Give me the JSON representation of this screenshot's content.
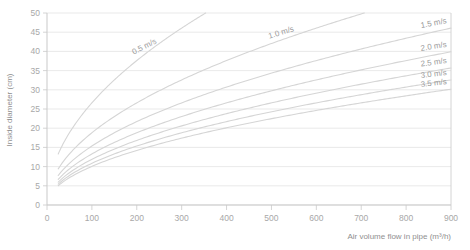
{
  "chart_data": {
    "type": "line",
    "title": "",
    "xlabel": "Air volume flow in pipe (m³/h)",
    "ylabel": "Inside diameter (cm)",
    "xlim": [
      0,
      900
    ],
    "ylim": [
      0,
      50
    ],
    "xticks": [
      0,
      100,
      200,
      300,
      400,
      500,
      600,
      700,
      800,
      900
    ],
    "yticks": [
      0,
      5,
      10,
      15,
      20,
      25,
      30,
      35,
      40,
      45,
      50
    ],
    "xtick_labels": [
      "0",
      "100",
      "200",
      "300",
      "400",
      "500",
      "600",
      "700",
      "800",
      "900"
    ],
    "ytick_labels": [
      "0",
      "5",
      "10",
      "15",
      "20",
      "25",
      "30",
      "35",
      "40",
      "45",
      "50"
    ],
    "grid": "horizontal",
    "legend": "inline-curve-labels",
    "line_color": "#d5d5d5",
    "grid_color": "#e3e3e3",
    "axis_color": "#c9c9c9",
    "text_color": "#a8a8a8",
    "relation": "d_cm = 200 * sqrt(Q / (3600 * pi * v))",
    "series": [
      {
        "name": "0.5 m/s",
        "velocity": 0.5,
        "label": "0.5 m/s",
        "label_rotation": -27,
        "x": [
          25,
          50,
          75,
          100,
          150,
          200,
          250,
          300,
          350
        ],
        "values": [
          4.7,
          6.7,
          8.2,
          9.4,
          11.5,
          13.3,
          14.9,
          16.3,
          17.6
        ]
      },
      {
        "name": "1.0 m/s",
        "velocity": 1.0,
        "label": "1.0 m/s",
        "label_rotation": -17,
        "x": [
          25,
          50,
          100,
          200,
          300,
          400,
          500,
          600,
          700
        ],
        "values": [
          3.3,
          4.7,
          6.7,
          9.4,
          11.5,
          13.3,
          14.9,
          16.3,
          17.6
        ]
      },
      {
        "name": "1.5 m/s",
        "velocity": 1.5,
        "label": "1.5 m/s",
        "label_rotation": -11,
        "x": [
          25,
          100,
          200,
          400,
          600,
          800,
          900
        ],
        "values": [
          2.7,
          5.5,
          7.7,
          10.9,
          13.3,
          15.4,
          16.3
        ]
      },
      {
        "name": "2.0 m/s",
        "velocity": 2.0,
        "label": "2.0 m/s",
        "label_rotation": -9,
        "x": [
          25,
          100,
          200,
          400,
          600,
          800,
          900
        ],
        "values": [
          2.4,
          4.7,
          6.7,
          9.4,
          11.5,
          13.3,
          14.1
        ]
      },
      {
        "name": "2.5 m/s",
        "velocity": 2.5,
        "label": "2.5 m/s",
        "label_rotation": -8,
        "x": [
          25,
          100,
          200,
          400,
          600,
          800,
          900
        ],
        "values": [
          2.1,
          4.2,
          6.0,
          8.4,
          10.3,
          11.9,
          12.6
        ]
      },
      {
        "name": "3.0 m/s",
        "velocity": 3.0,
        "label": "3.0 m/s",
        "label_rotation": -7,
        "x": [
          25,
          100,
          200,
          400,
          600,
          800,
          900
        ],
        "values": [
          1.9,
          3.8,
          5.5,
          7.7,
          9.4,
          10.9,
          11.5
        ]
      },
      {
        "name": "3.5 m/s",
        "velocity": 3.5,
        "label": "3.5 m/s",
        "label_rotation": -6,
        "x": [
          25,
          100,
          200,
          400,
          600,
          800,
          900
        ],
        "values": [
          1.8,
          3.6,
          5.1,
          7.1,
          8.7,
          10.1,
          10.7
        ]
      }
    ]
  },
  "axes": {
    "x_title": "Air volume flow in pipe (m³/h)",
    "y_title": "Inside diameter (cm)"
  }
}
